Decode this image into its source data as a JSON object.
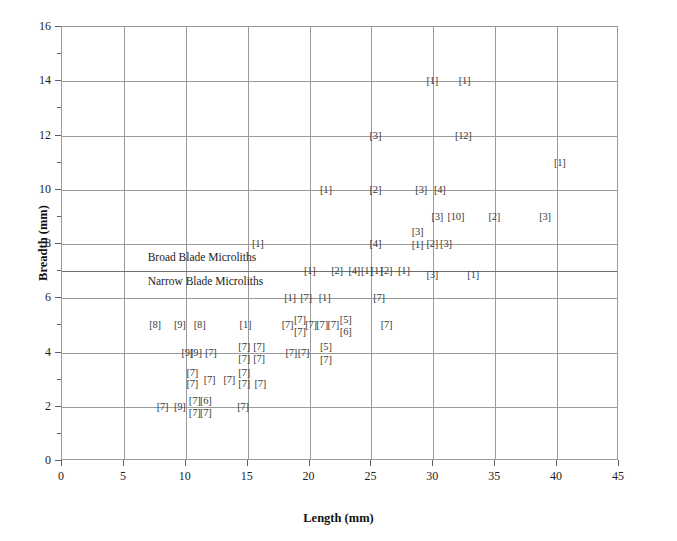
{
  "chart_data": {
    "type": "scatter",
    "title": "",
    "xlabel": "Length (mm)",
    "ylabel": "Breadth (mm)",
    "xlim": [
      0,
      45
    ],
    "ylim": [
      0,
      16
    ],
    "xticks": [
      0,
      5,
      10,
      15,
      20,
      25,
      30,
      35,
      40,
      45
    ],
    "yticks": [
      0,
      2,
      4,
      6,
      8,
      10,
      12,
      14,
      16
    ],
    "y_minor_ticks": [
      1,
      3,
      5,
      7,
      9,
      11,
      13,
      15
    ],
    "grid": "major gridlines on both axes",
    "legend": "none",
    "point_label_format": "[n] = count of artefacts at that length/breadth",
    "annotations": [
      {
        "text": "Broad Blade Microliths",
        "x": 7.0,
        "y": 7.45
      },
      {
        "text": "Narrow Blade Microliths",
        "x": 7.0,
        "y": 6.55
      }
    ],
    "divider_lines": [
      {
        "y": 7.0,
        "note": "boundary between broad and narrow blade microliths"
      }
    ],
    "points": [
      {
        "x": 30.0,
        "y": 14.0,
        "label": "[1]"
      },
      {
        "x": 32.6,
        "y": 14.0,
        "label": "[1]"
      },
      {
        "x": 25.4,
        "y": 12.0,
        "label": "[3]"
      },
      {
        "x": 32.5,
        "y": 12.0,
        "label": "[12]"
      },
      {
        "x": 40.3,
        "y": 11.0,
        "label": "[1]"
      },
      {
        "x": 21.4,
        "y": 10.0,
        "label": "[1]"
      },
      {
        "x": 25.4,
        "y": 10.0,
        "label": "[2]"
      },
      {
        "x": 29.1,
        "y": 10.0,
        "label": "[3]"
      },
      {
        "x": 30.6,
        "y": 10.0,
        "label": "[4]"
      },
      {
        "x": 30.4,
        "y": 9.0,
        "label": "[3]"
      },
      {
        "x": 31.9,
        "y": 9.0,
        "label": "[10]"
      },
      {
        "x": 35.0,
        "y": 9.0,
        "label": "[2]"
      },
      {
        "x": 39.1,
        "y": 9.0,
        "label": "[3]"
      },
      {
        "x": 15.9,
        "y": 8.0,
        "label": "[1]"
      },
      {
        "x": 25.4,
        "y": 8.0,
        "label": "[4]"
      },
      {
        "x": 28.8,
        "y": 8.45,
        "label": "[3]"
      },
      {
        "x": 28.8,
        "y": 7.95,
        "label": "[1]"
      },
      {
        "x": 30.0,
        "y": 8.0,
        "label": "[2]"
      },
      {
        "x": 31.1,
        "y": 8.0,
        "label": "[3]"
      },
      {
        "x": 20.1,
        "y": 7.0,
        "label": "[1]"
      },
      {
        "x": 22.3,
        "y": 7.0,
        "label": "[2]"
      },
      {
        "x": 23.7,
        "y": 7.0,
        "label": "[4]"
      },
      {
        "x": 24.7,
        "y": 7.0,
        "label": "[1]"
      },
      {
        "x": 25.5,
        "y": 7.0,
        "label": "[1]"
      },
      {
        "x": 26.3,
        "y": 7.0,
        "label": "[2]"
      },
      {
        "x": 27.7,
        "y": 7.0,
        "label": "[1]"
      },
      {
        "x": 30.0,
        "y": 6.85,
        "label": "[3]"
      },
      {
        "x": 33.3,
        "y": 6.85,
        "label": "[1]"
      },
      {
        "x": 18.5,
        "y": 6.0,
        "label": "[1]"
      },
      {
        "x": 19.8,
        "y": 6.0,
        "label": "[7]"
      },
      {
        "x": 21.3,
        "y": 6.0,
        "label": "[1]"
      },
      {
        "x": 25.7,
        "y": 6.0,
        "label": "[7]"
      },
      {
        "x": 7.6,
        "y": 5.0,
        "label": "[8]"
      },
      {
        "x": 9.6,
        "y": 5.0,
        "label": "[9]"
      },
      {
        "x": 11.2,
        "y": 5.0,
        "label": "[8]"
      },
      {
        "x": 14.9,
        "y": 5.0,
        "label": "[1]"
      },
      {
        "x": 18.3,
        "y": 5.0,
        "label": "[7]"
      },
      {
        "x": 19.3,
        "y": 5.2,
        "label": "[7]"
      },
      {
        "x": 19.3,
        "y": 4.75,
        "label": "[7]"
      },
      {
        "x": 20.2,
        "y": 5.0,
        "label": "[7]"
      },
      {
        "x": 21.1,
        "y": 5.0,
        "label": "[7]"
      },
      {
        "x": 22.0,
        "y": 5.0,
        "label": "[7]"
      },
      {
        "x": 23.0,
        "y": 5.2,
        "label": "[5]"
      },
      {
        "x": 23.0,
        "y": 4.75,
        "label": "[6]"
      },
      {
        "x": 26.3,
        "y": 5.0,
        "label": "[7]"
      },
      {
        "x": 10.2,
        "y": 4.0,
        "label": "[9]"
      },
      {
        "x": 10.9,
        "y": 4.0,
        "label": "[9]"
      },
      {
        "x": 12.1,
        "y": 4.0,
        "label": "[7]"
      },
      {
        "x": 14.8,
        "y": 4.2,
        "label": "[7]"
      },
      {
        "x": 16.0,
        "y": 4.2,
        "label": "[7]"
      },
      {
        "x": 14.8,
        "y": 3.75,
        "label": "[7]"
      },
      {
        "x": 16.0,
        "y": 3.75,
        "label": "[7]"
      },
      {
        "x": 18.6,
        "y": 4.0,
        "label": "[7]"
      },
      {
        "x": 19.6,
        "y": 4.0,
        "label": "[7]"
      },
      {
        "x": 21.4,
        "y": 4.2,
        "label": "[5]"
      },
      {
        "x": 21.4,
        "y": 3.72,
        "label": "[7]"
      },
      {
        "x": 10.6,
        "y": 3.25,
        "label": "[7]"
      },
      {
        "x": 10.6,
        "y": 2.85,
        "label": "[7]"
      },
      {
        "x": 12.0,
        "y": 3.0,
        "label": "[7]"
      },
      {
        "x": 13.6,
        "y": 3.0,
        "label": "[7]"
      },
      {
        "x": 14.8,
        "y": 3.25,
        "label": "[7]"
      },
      {
        "x": 14.8,
        "y": 2.85,
        "label": "[7]"
      },
      {
        "x": 16.1,
        "y": 2.85,
        "label": "[7]"
      },
      {
        "x": 8.2,
        "y": 2.0,
        "label": "[7]"
      },
      {
        "x": 9.6,
        "y": 2.0,
        "label": "[9]"
      },
      {
        "x": 10.8,
        "y": 2.2,
        "label": "[7]"
      },
      {
        "x": 11.7,
        "y": 2.2,
        "label": "[6]"
      },
      {
        "x": 10.8,
        "y": 1.78,
        "label": "[7]"
      },
      {
        "x": 11.7,
        "y": 1.78,
        "label": "[7]"
      },
      {
        "x": 14.7,
        "y": 2.0,
        "label": "[7]"
      }
    ]
  }
}
